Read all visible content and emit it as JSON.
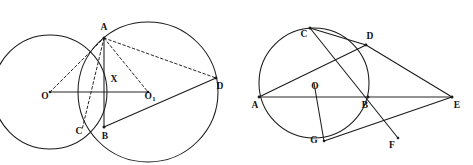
{
  "figure": {
    "background_color": "#ffffff",
    "ink_color": "#1a1a1a",
    "width": 473,
    "height": 165
  },
  "left_figure": {
    "name": "two-intersecting-circles",
    "labels": {
      "A": "A",
      "B": "B",
      "C": "C",
      "D": "D",
      "X": "X",
      "O": "O",
      "O1_main": "O",
      "O1_sub": "1"
    },
    "label_positions": {
      "A": {
        "x": 104,
        "y": 28
      },
      "B": {
        "x": 105,
        "y": 137
      },
      "C": {
        "x": 79,
        "y": 132
      },
      "D": {
        "x": 220,
        "y": 87
      },
      "X": {
        "x": 114,
        "y": 80
      },
      "O": {
        "x": 45,
        "y": 97
      },
      "O1": {
        "x": 150,
        "y": 97
      }
    },
    "circles": [
      {
        "name": "left-circle",
        "cx": 50,
        "cy": 92,
        "r": 57
      },
      {
        "name": "right-circle",
        "cx": 148,
        "cy": 92,
        "r": 70
      }
    ],
    "solid_segments": [
      {
        "name": "chord-ab",
        "x1": 104,
        "y1": 38,
        "x2": 104,
        "y2": 127
      },
      {
        "name": "centerline-o-o1",
        "x1": 50,
        "y1": 92,
        "x2": 148,
        "y2": 92
      },
      {
        "name": "segment-bd",
        "x1": 104,
        "y1": 127,
        "x2": 216,
        "y2": 78
      }
    ],
    "dashed_segments": [
      {
        "name": "segment-oa",
        "x1": 50,
        "y1": 92,
        "x2": 104,
        "y2": 38
      },
      {
        "name": "segment-ac",
        "x1": 104,
        "y1": 38,
        "x2": 82,
        "y2": 130
      },
      {
        "name": "segment-ao1",
        "x1": 104,
        "y1": 38,
        "x2": 148,
        "y2": 92
      },
      {
        "name": "segment-ad",
        "x1": 104,
        "y1": 38,
        "x2": 216,
        "y2": 78
      }
    ],
    "vertices": [
      {
        "name": "point-a",
        "x": 104,
        "y": 38
      },
      {
        "name": "point-b",
        "x": 104,
        "y": 127
      },
      {
        "name": "point-d",
        "x": 216,
        "y": 78
      },
      {
        "name": "point-o",
        "x": 50,
        "y": 92
      },
      {
        "name": "point-o1",
        "x": 148,
        "y": 92
      }
    ]
  },
  "right_figure": {
    "name": "circle-with-secants",
    "labels": {
      "A": "A",
      "B": "B",
      "C": "C",
      "D": "D",
      "E": "E",
      "F": "F",
      "G": "G",
      "O": "O"
    },
    "label_positions": {
      "A": {
        "x": 255,
        "y": 106
      },
      "B": {
        "x": 365,
        "y": 106
      },
      "C": {
        "x": 304,
        "y": 35
      },
      "D": {
        "x": 370,
        "y": 37
      },
      "E": {
        "x": 457,
        "y": 106
      },
      "F": {
        "x": 392,
        "y": 146
      },
      "G": {
        "x": 314,
        "y": 141
      },
      "O": {
        "x": 315,
        "y": 87
      }
    },
    "circles": [
      {
        "name": "main-circle",
        "cx": 314,
        "cy": 83,
        "r": 55
      }
    ],
    "solid_segments": [
      {
        "name": "line-ae",
        "x1": 259,
        "y1": 97,
        "x2": 452,
        "y2": 97
      },
      {
        "name": "line-ad-extended",
        "x1": 259,
        "y1": 97,
        "x2": 452,
        "y2": 97
      },
      {
        "name": "chord-ad",
        "x1": 259,
        "y1": 97,
        "x2": 366,
        "y2": 45
      },
      {
        "name": "segment-de",
        "x1": 366,
        "y1": 45,
        "x2": 452,
        "y2": 97
      },
      {
        "name": "segment-cf",
        "x1": 310,
        "y1": 28,
        "x2": 398,
        "y2": 138
      },
      {
        "name": "segment-cd",
        "x1": 310,
        "y1": 28,
        "x2": 366,
        "y2": 45
      },
      {
        "name": "segment-og",
        "x1": 314,
        "y1": 83,
        "x2": 324,
        "y2": 141
      },
      {
        "name": "segment-ge",
        "x1": 324,
        "y1": 141,
        "x2": 452,
        "y2": 97
      }
    ],
    "vertices": [
      {
        "name": "point-a",
        "x": 259,
        "y": 97
      },
      {
        "name": "point-b",
        "x": 368,
        "y": 97
      },
      {
        "name": "point-c",
        "x": 310,
        "y": 28
      },
      {
        "name": "point-d",
        "x": 366,
        "y": 45
      },
      {
        "name": "point-e",
        "x": 452,
        "y": 97
      },
      {
        "name": "point-f",
        "x": 398,
        "y": 138
      },
      {
        "name": "point-g",
        "x": 324,
        "y": 141
      }
    ]
  }
}
